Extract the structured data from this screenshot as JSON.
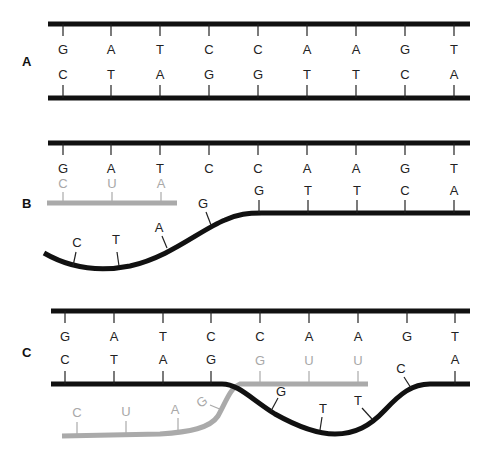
{
  "diagram": {
    "colors": {
      "dna": "#111111",
      "rna": "#aaaaaa",
      "background": "#ffffff"
    },
    "panels": [
      {
        "label": "A",
        "description": "Double-stranded DNA",
        "top_strand": [
          "G",
          "A",
          "T",
          "C",
          "C",
          "A",
          "A",
          "G",
          "T"
        ],
        "bottom_strand": [
          "C",
          "T",
          "A",
          "G",
          "G",
          "T",
          "T",
          "C",
          "A"
        ]
      },
      {
        "label": "B",
        "description": "Strands separated; RNA pairs with top strand",
        "top_strand": [
          "G",
          "A",
          "T",
          "C",
          "C",
          "A",
          "A",
          "G",
          "T"
        ],
        "rna_strand": [
          "C",
          "U",
          "A"
        ],
        "displaced_dna": [
          "C",
          "T",
          "A",
          "G"
        ],
        "paired_bottom": [
          "G",
          "T",
          "T",
          "C",
          "A"
        ]
      },
      {
        "label": "C",
        "description": "RNA invades bottom strand region, displacing DNA",
        "top_strand": [
          "G",
          "A",
          "T",
          "C",
          "C",
          "A",
          "A",
          "G",
          "T"
        ],
        "bottom_paired_left": [
          "C",
          "T",
          "A",
          "G"
        ],
        "rna_paired": [
          "G",
          "U",
          "U"
        ],
        "rna_tail": [
          "C",
          "U",
          "A",
          "G"
        ],
        "displaced_dna": [
          "G",
          "T",
          "T",
          "C"
        ],
        "bottom_paired_right": [
          "A"
        ]
      }
    ]
  }
}
